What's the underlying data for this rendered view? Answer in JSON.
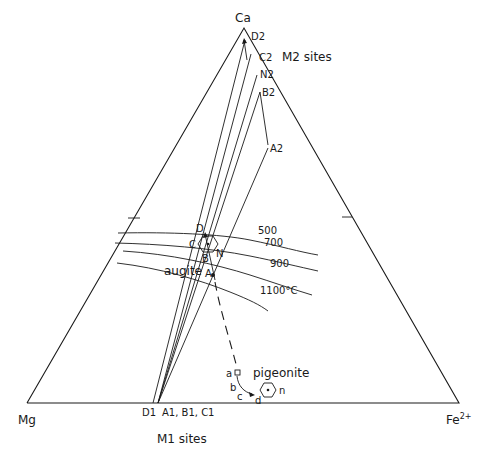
{
  "diagram": {
    "vertices": {
      "top": "Ca",
      "left": "Mg",
      "right_base": "Fe",
      "right_sup": "2+"
    },
    "site_labels": {
      "m2": "M2 sites",
      "m1": "M1 sites"
    },
    "m2_points": [
      "D2",
      "C2",
      "N2",
      "B2",
      "A2"
    ],
    "m1_points": {
      "d1": "D1",
      "abc1": "A1, B1, C1"
    },
    "augite_points": [
      "D",
      "C",
      "N",
      "B",
      "A"
    ],
    "pigeonite_points": [
      "a",
      "b",
      "c",
      "d",
      "n"
    ],
    "phases": {
      "augite": "augite",
      "pigeonite": "pigeonite"
    },
    "isotherms": [
      "500",
      "700",
      "900",
      "1100°C"
    ]
  }
}
